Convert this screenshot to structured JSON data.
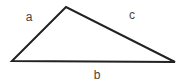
{
  "diagram": {
    "type": "triangle",
    "vertices": {
      "left": {
        "x": 12,
        "y": 61
      },
      "top": {
        "x": 66,
        "y": 7
      },
      "right": {
        "x": 175,
        "y": 62
      }
    },
    "sides": [
      {
        "id": "a",
        "label": "a",
        "from": "left",
        "to": "top",
        "label_pos": {
          "x": 29,
          "y": 21
        }
      },
      {
        "id": "c",
        "label": "c",
        "from": "top",
        "to": "right",
        "label_pos": {
          "x": 132,
          "y": 19
        }
      },
      {
        "id": "b",
        "label": "b",
        "from": "left",
        "to": "right",
        "label_pos": {
          "x": 97,
          "y": 79
        }
      }
    ],
    "stroke_color": "#222222",
    "label_color": "#444444",
    "background": "#ffffff"
  }
}
